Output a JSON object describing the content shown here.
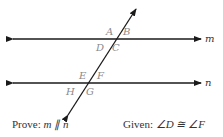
{
  "diagram": {
    "type": "parallel-lines-cut-by-transversal",
    "lines": [
      {
        "name": "m",
        "label": "m",
        "y": 39
      },
      {
        "name": "n",
        "label": "n",
        "y": 83
      }
    ],
    "angle_labels": {
      "top": [
        "A",
        "B",
        "D",
        "C"
      ],
      "bottom": [
        "E",
        "F",
        "H",
        "G"
      ]
    },
    "colors": {
      "line": "#1a1a1a",
      "angle_label": "#8a8a8a",
      "text": "#333333"
    }
  },
  "captions": {
    "prove_prefix": "Prove: ",
    "prove_statement": "m ∥ n",
    "given_prefix": "Given: ",
    "given_statement": "∠D ≅ ∠F"
  }
}
